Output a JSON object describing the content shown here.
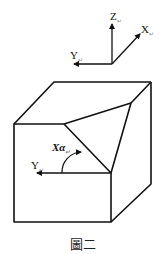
{
  "figure": {
    "caption": "圖二",
    "axes": {
      "z_label": "Z",
      "x_label": "X",
      "y_label": "Y"
    },
    "cube": {
      "y_label": "Y",
      "angle_label": "Xα"
    },
    "colors": {
      "line": "#111111",
      "background": "#ffffff"
    }
  }
}
